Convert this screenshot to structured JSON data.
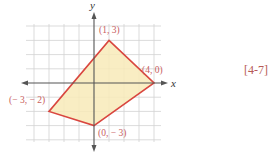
{
  "figure": {
    "reference": "[4-7]",
    "axes": {
      "x_label": "x",
      "y_label": "y",
      "x_range": [
        -4,
        4
      ],
      "y_range": [
        -4,
        4
      ],
      "grid": true
    },
    "polygon": {
      "vertices": [
        {
          "x": 1,
          "y": 3,
          "label": "(1, 3)"
        },
        {
          "x": 4,
          "y": 0,
          "label": "(4, 0)"
        },
        {
          "x": 0,
          "y": -3,
          "label": "(0, − 3)"
        },
        {
          "x": -3,
          "y": -2,
          "label": "(− 3, − 2)"
        }
      ]
    },
    "colors": {
      "fill": "#f8eab8",
      "stroke": "#d9463f",
      "label": "#c8605e",
      "grid": "#d2d2d2",
      "axis": "#555555",
      "reference": "#b65a55"
    }
  }
}
